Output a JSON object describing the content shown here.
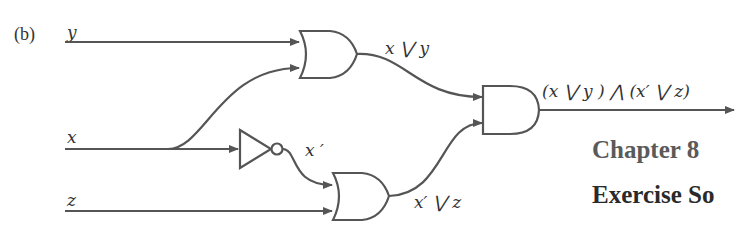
{
  "part_label": "(b)",
  "inputs": {
    "y": "y",
    "x": "x",
    "z": "z"
  },
  "gates": {
    "or1": {
      "type": "OR",
      "output_label": "x ⋁ y"
    },
    "not1": {
      "type": "NOT",
      "output_label": "x ′"
    },
    "or2": {
      "type": "OR",
      "output_label": "x′ ⋁ z"
    },
    "and1": {
      "type": "AND",
      "output_label": "(x ⋁ y ) ⋀ (x′ ⋁ z)"
    }
  },
  "headings": {
    "chapter": "Chapter 8",
    "exercise": "Exercise So"
  },
  "colors": {
    "line": "#555555",
    "text": "#333333"
  }
}
